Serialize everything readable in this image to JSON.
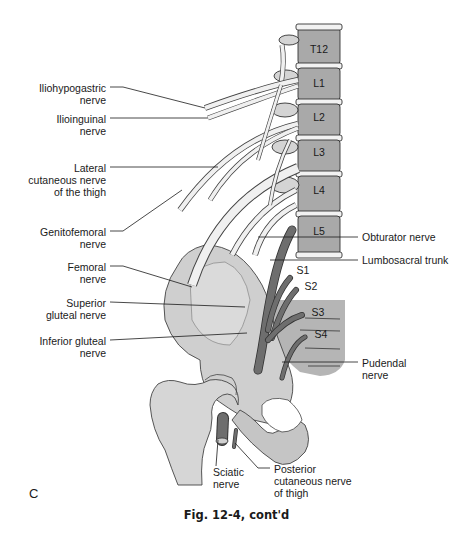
{
  "figure": {
    "panel_letter": "C",
    "caption": "Fig. 12-4, cont'd",
    "colors": {
      "bone": "#c9c9c9",
      "bone_light": "#e4e4e4",
      "vertebra": "#a9a9a9",
      "nerve_light": "#eeeeee",
      "nerve_dark": "#6e6e6e",
      "line": "#1a1a1a"
    }
  },
  "vertebrae": [
    {
      "label": "T12"
    },
    {
      "label": "L1"
    },
    {
      "label": "L2"
    },
    {
      "label": "L3"
    },
    {
      "label": "L4"
    },
    {
      "label": "L5"
    }
  ],
  "sacral": [
    {
      "label": "S1"
    },
    {
      "label": "S2"
    },
    {
      "label": "S3"
    },
    {
      "label": "S4"
    }
  ],
  "left_labels": [
    {
      "text": "Iliohypogastric\nnerve"
    },
    {
      "text": "Ilioinguinal\nnerve"
    },
    {
      "text": "Lateral\ncutaneous nerve\nof the thigh"
    },
    {
      "text": "Genitofemoral\nnerve"
    },
    {
      "text": "Femoral\nnerve"
    },
    {
      "text": "Superior\ngluteal nerve"
    },
    {
      "text": "Inferior gluteal\nnerve"
    }
  ],
  "right_labels": [
    {
      "text": "Obturator nerve"
    },
    {
      "text": "Lumbosacral trunk"
    },
    {
      "text": "Pudendal\nnerve"
    }
  ],
  "bottom_labels": [
    {
      "text": "Sciatic\nnerve"
    },
    {
      "text": "Posterior\ncutaneous nerve\nof thigh"
    }
  ]
}
